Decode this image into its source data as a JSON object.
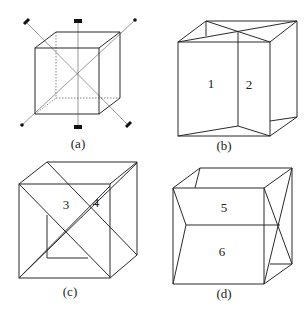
{
  "figure": {
    "panels": [
      {
        "id": "a",
        "caption": "(a)",
        "face_labels": []
      },
      {
        "id": "b",
        "caption": "(b)",
        "face_labels": [
          "1",
          "2"
        ]
      },
      {
        "id": "c",
        "caption": "(c)",
        "face_labels": [
          "3",
          "4"
        ]
      },
      {
        "id": "d",
        "caption": "(d)",
        "face_labels": [
          "5",
          "6"
        ]
      }
    ]
  }
}
